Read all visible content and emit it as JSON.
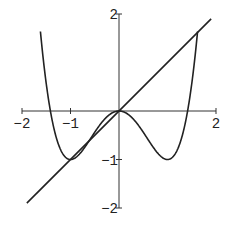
{
  "chart_data": {
    "type": "line",
    "title": "",
    "xlabel": "",
    "ylabel": "",
    "xlim": [
      -2,
      2
    ],
    "ylim": [
      -2,
      2
    ],
    "grid": false,
    "legend": null,
    "x_ticks": [
      "-2",
      "-1",
      "2"
    ],
    "y_ticks": [
      "2",
      "-1",
      "-2"
    ],
    "series": [
      {
        "name": "x^4 - 2x^2",
        "expression": "y = x^4 - 2x^2",
        "x": [
          -1.6,
          -1.5,
          -1.414,
          -1.2,
          -1.0,
          -0.8,
          -0.5,
          0,
          0.5,
          0.8,
          1.0,
          1.2,
          1.414,
          1.5,
          1.6
        ],
        "values": [
          2.15,
          0.56,
          0.0,
          -0.81,
          -1.0,
          -0.87,
          -0.44,
          0,
          -0.44,
          -0.87,
          -1.0,
          -0.81,
          0.0,
          0.56,
          2.15
        ]
      },
      {
        "name": "x",
        "expression": "y = x",
        "x": [
          -1.9,
          1.9
        ],
        "values": [
          -1.9,
          1.9
        ]
      }
    ]
  }
}
